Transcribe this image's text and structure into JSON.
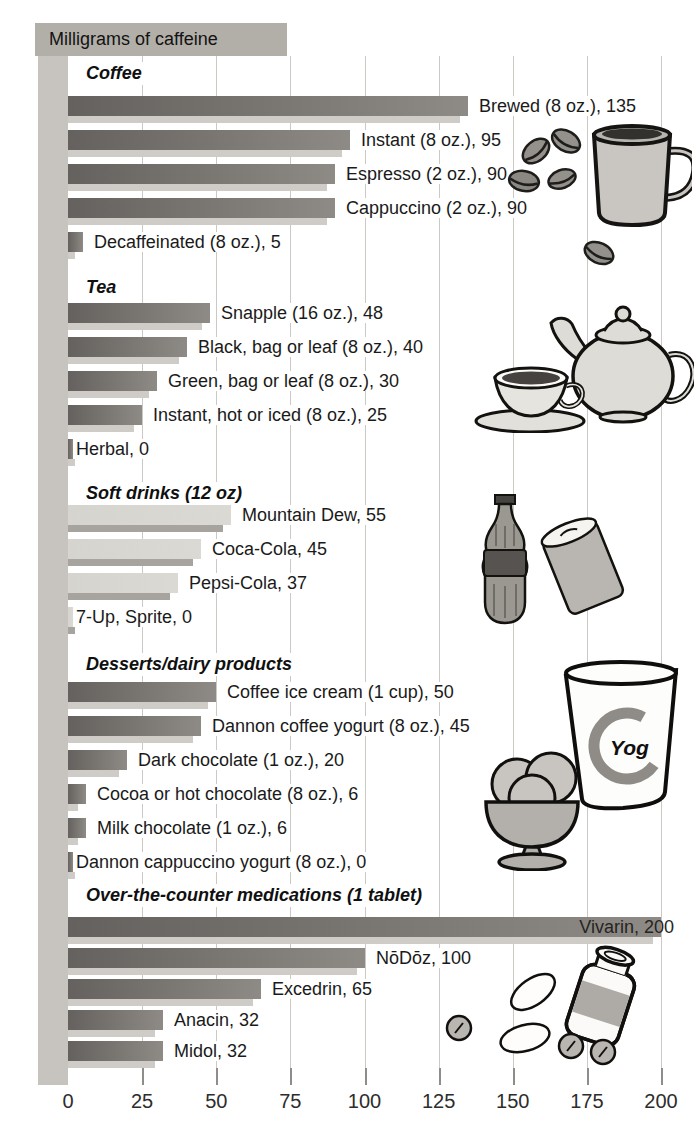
{
  "title_band": {
    "text": "Milligrams of caffeine"
  },
  "axis": {
    "tick_labels": [
      "0",
      "25",
      "50",
      "75",
      "100",
      "125",
      "150",
      "175",
      "200"
    ]
  },
  "chart_data": {
    "type": "bar",
    "orientation": "horizontal",
    "title": "Milligrams of caffeine",
    "xlabel": "Milligrams of caffeine",
    "xlim": [
      0,
      200
    ],
    "x_ticks": [
      0,
      25,
      50,
      75,
      100,
      125,
      150,
      175,
      200
    ],
    "grid": true,
    "groups": [
      {
        "label": "Coffee",
        "style": "dark",
        "items": [
          {
            "name": "Brewed (8 oz.)",
            "value": 135,
            "label": "Brewed (8 oz.), 135"
          },
          {
            "name": "Instant (8 oz.)",
            "value": 95,
            "label": "Instant (8 oz.), 95"
          },
          {
            "name": "Espresso (2 oz.)",
            "value": 90,
            "label": "Espresso (2 oz.), 90"
          },
          {
            "name": "Cappuccino (2 oz.)",
            "value": 90,
            "label": "Cappuccino (2 oz.), 90"
          },
          {
            "name": "Decaffeinated (8 oz.)",
            "value": 5,
            "label": "Decaffeinated (8 oz.), 5"
          }
        ]
      },
      {
        "label": "Tea",
        "style": "dark",
        "items": [
          {
            "name": "Snapple (16 oz.)",
            "value": 48,
            "label": "Snapple (16 oz.), 48"
          },
          {
            "name": "Black, bag or leaf (8 oz.)",
            "value": 40,
            "label": "Black, bag or leaf (8 oz.), 40"
          },
          {
            "name": "Green, bag or leaf (8 oz.)",
            "value": 30,
            "label": "Green, bag or leaf (8 oz.), 30"
          },
          {
            "name": "Instant, hot or iced (8 oz.)",
            "value": 25,
            "label": "Instant, hot or iced (8 oz.), 25"
          },
          {
            "name": "Herbal",
            "value": 0,
            "label": "Herbal, 0"
          }
        ]
      },
      {
        "label": "Soft drinks (12 oz)",
        "style": "light",
        "items": [
          {
            "name": "Mountain Dew",
            "value": 55,
            "label": "Mountain Dew, 55"
          },
          {
            "name": "Coca-Cola",
            "value": 45,
            "label": "Coca-Cola, 45"
          },
          {
            "name": "Pepsi-Cola",
            "value": 37,
            "label": "Pepsi-Cola, 37"
          },
          {
            "name": "7-Up, Sprite",
            "value": 0,
            "label": "7-Up, Sprite, 0"
          }
        ]
      },
      {
        "label": "Desserts/dairy products",
        "style": "dark",
        "items": [
          {
            "name": "Coffee ice cream (1 cup)",
            "value": 50,
            "label": "Coffee ice cream (1 cup), 50"
          },
          {
            "name": "Dannon coffee yogurt (8 oz.)",
            "value": 45,
            "label": "Dannon coffee yogurt (8 oz.), 45"
          },
          {
            "name": "Dark chocolate (1 oz.)",
            "value": 20,
            "label": "Dark chocolate (1 oz.), 20"
          },
          {
            "name": "Cocoa or hot chocolate (8 oz.)",
            "value": 6,
            "label": "Cocoa or hot chocolate (8 oz.), 6"
          },
          {
            "name": "Milk chocolate (1 oz.)",
            "value": 6,
            "label": "Milk chocolate (1 oz.), 6"
          },
          {
            "name": "Dannon cappuccino yogurt (8 oz.)",
            "value": 0,
            "label": "Dannon cappuccino yogurt (8 oz.), 0"
          }
        ]
      },
      {
        "label": "Over-the-counter medications (1 tablet)",
        "style": "dark",
        "items": [
          {
            "name": "Vivarin",
            "value": 200,
            "label": "Vivarin, 200"
          },
          {
            "name": "NōDōz",
            "value": 100,
            "label": "NōDōz, 100"
          },
          {
            "name": "Excedrin",
            "value": 65,
            "label": "Excedrin, 65"
          },
          {
            "name": "Anacin",
            "value": 32,
            "label": "Anacin, 32"
          },
          {
            "name": "Midol",
            "value": 32,
            "label": "Midol, 32"
          }
        ]
      }
    ],
    "colors": {
      "bar_dark": "#64615e",
      "bar_dark_end": "#8e8b86",
      "bar_dark_shadow": "#cfccc7",
      "bar_light": "#d6d4cf",
      "bar_light_shadow": "#a7a49f",
      "title_band": "#b2afa9",
      "left_strip": "#c7c4bf",
      "gridline": "#ccc9c5"
    }
  },
  "illustrations": {
    "coffee": "coffee beans and mug",
    "tea": "teapot and teacup",
    "soft_drinks": "cola bottle and soda can",
    "desserts": "ice cream sundae and yogurt cup",
    "medications": "pills and pill bottle",
    "yogurt_cup_label": "Yog"
  }
}
